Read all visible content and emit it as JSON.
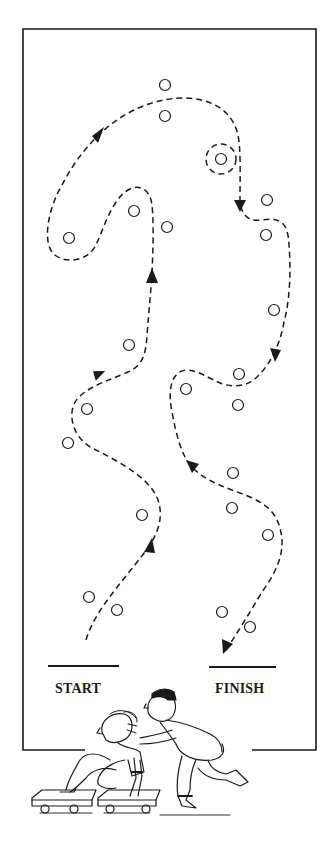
{
  "diagram": {
    "labels": {
      "start": "START",
      "finish": "FINISH"
    },
    "colors": {
      "ink": "#1a1a1a",
      "background": "#ffffff"
    },
    "frame": {
      "left": 23,
      "top": 29,
      "right": 316,
      "bottom": 750,
      "bottom_gap_from": 85,
      "bottom_gap_to": 252
    },
    "start_line": {
      "x1": 48,
      "x2": 119,
      "y": 666
    },
    "finish_line": {
      "x1": 209,
      "x2": 276,
      "y": 667
    },
    "cones": [
      {
        "x": 165,
        "y": 85
      },
      {
        "x": 165,
        "y": 116
      },
      {
        "x": 221,
        "y": 159
      },
      {
        "x": 267,
        "y": 200
      },
      {
        "x": 266,
        "y": 235
      },
      {
        "x": 69,
        "y": 238
      },
      {
        "x": 134,
        "y": 211
      },
      {
        "x": 167,
        "y": 227
      },
      {
        "x": 274,
        "y": 310
      },
      {
        "x": 239,
        "y": 374
      },
      {
        "x": 186,
        "y": 389
      },
      {
        "x": 238,
        "y": 405
      },
      {
        "x": 129,
        "y": 345
      },
      {
        "x": 87,
        "y": 409
      },
      {
        "x": 68,
        "y": 443
      },
      {
        "x": 233,
        "y": 473
      },
      {
        "x": 232,
        "y": 508
      },
      {
        "x": 142,
        "y": 515
      },
      {
        "x": 268,
        "y": 535
      },
      {
        "x": 89,
        "y": 597
      },
      {
        "x": 117,
        "y": 610
      },
      {
        "x": 222,
        "y": 612
      },
      {
        "x": 250,
        "y": 627
      }
    ],
    "illustration": {
      "description": "Child sitting on two scooter boards pushed by a running adult",
      "icon": "scooter-board-relay-illustration"
    }
  }
}
